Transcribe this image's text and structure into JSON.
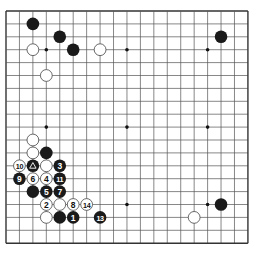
{
  "diagram": {
    "type": "go-board",
    "size": 19,
    "origin": {
      "x": 6,
      "y": 11
    },
    "spacing": {
      "x": 13.44,
      "y": 12.9
    },
    "stone_radius": 6.3,
    "colors": {
      "line": "#555555",
      "border": "#333333",
      "black_stone": "#1a1a1a",
      "white_stone": "#ffffff",
      "white_outline": "#444444",
      "background": "#ffffff"
    },
    "star_points": [
      [
        3,
        3
      ],
      [
        9,
        3
      ],
      [
        15,
        3
      ],
      [
        3,
        9
      ],
      [
        9,
        9
      ],
      [
        15,
        9
      ],
      [
        3,
        15
      ],
      [
        9,
        15
      ],
      [
        15,
        15
      ]
    ],
    "stones": [
      {
        "color": "black",
        "col": 2,
        "row": 1,
        "label": ""
      },
      {
        "color": "black",
        "col": 4,
        "row": 2,
        "label": ""
      },
      {
        "color": "black",
        "col": 5,
        "row": 3,
        "label": ""
      },
      {
        "color": "white",
        "col": 2,
        "row": 3,
        "label": ""
      },
      {
        "color": "white",
        "col": 7,
        "row": 3,
        "label": ""
      },
      {
        "color": "white",
        "col": 3,
        "row": 5,
        "label": ""
      },
      {
        "color": "black",
        "col": 16,
        "row": 2,
        "label": ""
      },
      {
        "color": "white",
        "col": 2,
        "row": 10,
        "label": ""
      },
      {
        "color": "white",
        "col": 2,
        "row": 11,
        "label": ""
      },
      {
        "color": "black",
        "col": 3,
        "row": 11,
        "label": ""
      },
      {
        "color": "white",
        "col": 1,
        "row": 12,
        "label": "10"
      },
      {
        "color": "black",
        "col": 2,
        "row": 12,
        "label": "",
        "marker": "triangle"
      },
      {
        "color": "white",
        "col": 3,
        "row": 12,
        "label": ""
      },
      {
        "color": "black",
        "col": 4,
        "row": 12,
        "label": "3"
      },
      {
        "color": "black",
        "col": 1,
        "row": 13,
        "label": "9"
      },
      {
        "color": "white",
        "col": 2,
        "row": 13,
        "label": "6"
      },
      {
        "color": "white",
        "col": 3,
        "row": 13,
        "label": "4"
      },
      {
        "color": "black",
        "col": 4,
        "row": 13,
        "label": "11"
      },
      {
        "color": "black",
        "col": 2,
        "row": 14,
        "label": ""
      },
      {
        "color": "black",
        "col": 3,
        "row": 14,
        "label": "5"
      },
      {
        "color": "black",
        "col": 4,
        "row": 14,
        "label": "7"
      },
      {
        "color": "white",
        "col": 3,
        "row": 15,
        "label": "2"
      },
      {
        "color": "white",
        "col": 4,
        "row": 15,
        "label": ""
      },
      {
        "color": "white",
        "col": 5,
        "row": 15,
        "label": "8"
      },
      {
        "color": "white",
        "col": 6,
        "row": 15,
        "label": "14"
      },
      {
        "color": "white",
        "col": 3,
        "row": 16,
        "label": ""
      },
      {
        "color": "black",
        "col": 4,
        "row": 16,
        "label": ""
      },
      {
        "color": "black",
        "col": 5,
        "row": 16,
        "label": "1"
      },
      {
        "color": "black",
        "col": 7,
        "row": 16,
        "label": "13"
      },
      {
        "color": "black",
        "col": 16,
        "row": 15,
        "label": ""
      },
      {
        "color": "white",
        "col": 14,
        "row": 16,
        "label": ""
      }
    ]
  }
}
